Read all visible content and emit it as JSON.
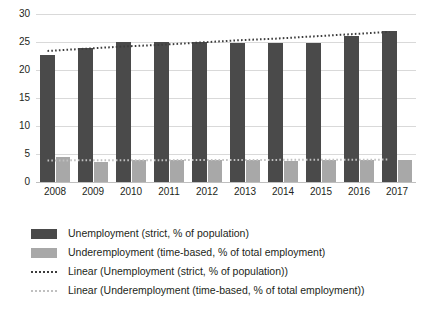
{
  "chart_data": {
    "type": "bar",
    "title": "",
    "subtitle": "",
    "xlabel": "",
    "ylabel": "",
    "ylim": [
      0,
      30
    ],
    "yticks": [
      0,
      5,
      10,
      15,
      20,
      25,
      30
    ],
    "grid": true,
    "legend_position": "bottom-left",
    "categories": [
      "2008",
      "2009",
      "2010",
      "2011",
      "2012",
      "2013",
      "2014",
      "2015",
      "2016",
      "2017"
    ],
    "series": [
      {
        "name": "Unemployment (strict, % of population)",
        "type": "bar",
        "color": "#4a4a4a",
        "values": [
          22.6,
          23.9,
          25.0,
          25.0,
          25.0,
          24.9,
          24.9,
          24.8,
          26.1,
          27.0
        ]
      },
      {
        "name": "Underemployment (time-based, % of total employment)",
        "type": "bar",
        "color": "#a8a8a8",
        "values": [
          4.5,
          3.6,
          3.9,
          3.9,
          3.9,
          3.9,
          3.8,
          4.0,
          4.0,
          4.0
        ]
      },
      {
        "name": "Linear (Unemployment (strict, % of population))",
        "type": "line",
        "style": "dotted",
        "color": "#3d3d3d",
        "values": [
          23.4,
          23.8,
          24.2,
          24.5,
          24.9,
          25.3,
          25.6,
          26.0,
          26.4,
          26.8
        ]
      },
      {
        "name": "Linear (Underemployment (time-based, % of total employment))",
        "type": "line",
        "style": "dotted",
        "color": "#c0c0c0",
        "values": [
          3.85,
          3.87,
          3.88,
          3.9,
          3.92,
          3.93,
          3.95,
          3.97,
          3.98,
          4.0
        ]
      }
    ]
  },
  "axis": {
    "y_ticks": [
      "30",
      "25",
      "20",
      "15",
      "10",
      "5",
      "0"
    ],
    "x_ticks": [
      "2008",
      "2009",
      "2010",
      "2011",
      "2012",
      "2013",
      "2014",
      "2015",
      "2016",
      "2017"
    ]
  },
  "legend": {
    "items": [
      {
        "key": "swatch-dark",
        "label": "Unemployment (strict, % of population)"
      },
      {
        "key": "swatch-gray",
        "label": "Underemployment (time-based, % of total employment)"
      },
      {
        "key": "dotted-dark",
        "label": "Linear (Unemployment (strict, % of population))"
      },
      {
        "key": "dotted-gray",
        "label": "Linear (Underemployment (time-based, % of total employment))"
      }
    ]
  },
  "colors": {
    "unemployment": "#4a4a4a",
    "underemployment": "#a8a8a8",
    "trend_unemployment": "#3d3d3d",
    "trend_underemployment": "#c0c0c0",
    "gridline": "#d9d9d9",
    "background": "#ffffff",
    "text": "#231f20"
  }
}
